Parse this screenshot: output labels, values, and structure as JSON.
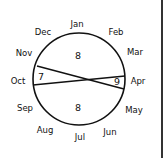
{
  "diagram": {
    "type": "circular-month-partition",
    "circle": {
      "cx": 79,
      "cy": 79,
      "r": 46,
      "stroke": "#111111"
    },
    "months": [
      {
        "label": "Jan",
        "x": 77,
        "y": 27
      },
      {
        "label": "Feb",
        "x": 116,
        "y": 35
      },
      {
        "label": "Mar",
        "x": 135,
        "y": 55
      },
      {
        "label": "Apr",
        "x": 138,
        "y": 84
      },
      {
        "label": "May",
        "x": 134,
        "y": 113
      },
      {
        "label": "Jun",
        "x": 110,
        "y": 135
      },
      {
        "label": "Jul",
        "x": 80,
        "y": 140
      },
      {
        "label": "Aug",
        "x": 45,
        "y": 133
      },
      {
        "label": "Sep",
        "x": 25,
        "y": 111
      },
      {
        "label": "Oct",
        "x": 18,
        "y": 84
      },
      {
        "label": "Nov",
        "x": 24,
        "y": 56
      },
      {
        "label": "Dec",
        "x": 43,
        "y": 35
      }
    ],
    "chords": [
      {
        "from": "Nov/Oct boundary",
        "to": "Apr/May boundary",
        "x1": 37,
        "y1": 66,
        "x2": 124,
        "y2": 89
      },
      {
        "from": "Oct/Sep boundary",
        "to": "Mar/Apr boundary",
        "x1": 33,
        "y1": 85,
        "x2": 125,
        "y2": 76
      }
    ],
    "region_values": [
      {
        "region": "top",
        "value": "8",
        "x": 78,
        "y": 59
      },
      {
        "region": "left",
        "value": "7",
        "x": 41,
        "y": 80
      },
      {
        "region": "right",
        "value": "9",
        "x": 117,
        "y": 85
      },
      {
        "region": "bottom",
        "value": "8",
        "x": 78,
        "y": 111
      }
    ]
  }
}
